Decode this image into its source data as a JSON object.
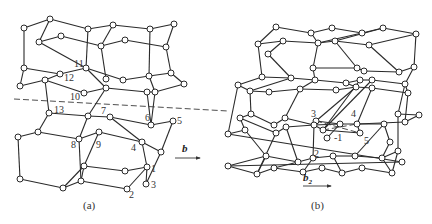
{
  "panels": [
    {
      "id": "a",
      "caption": "(a)",
      "caption_pos": [
        83,
        209
      ],
      "vector": {
        "label": "b",
        "subscript": "",
        "label_pos": [
          182,
          152
        ],
        "arrow": [
          [
            175,
            158
          ],
          [
            200,
            158
          ]
        ]
      },
      "dashed_line": [
        [
          14,
          99
        ],
        [
          228,
          111
        ]
      ],
      "nodes": [
        [
          24,
          28
        ],
        [
          50,
          19
        ],
        [
          88,
          29
        ],
        [
          113,
          25
        ],
        [
          150,
          29
        ],
        [
          174,
          24
        ],
        [
          39,
          42
        ],
        [
          61,
          36
        ],
        [
          101,
          46
        ],
        [
          125,
          40
        ],
        [
          166,
          47
        ],
        [
          24,
          68
        ],
        [
          60,
          74
        ],
        [
          86,
          68
        ],
        [
          106,
          79
        ],
        [
          123,
          80
        ],
        [
          149,
          76
        ],
        [
          171,
          73
        ],
        [
          184,
          84
        ],
        [
          20,
          86
        ],
        [
          45,
          80
        ],
        [
          84,
          93
        ],
        [
          106,
          88
        ],
        [
          147,
          92
        ],
        [
          155,
          92
        ],
        [
          49,
          113
        ],
        [
          88,
          116
        ],
        [
          110,
          117
        ],
        [
          151,
          125
        ],
        [
          173,
          121
        ],
        [
          38,
          132
        ],
        [
          18,
          137
        ],
        [
          79,
          139
        ],
        [
          99,
          132
        ],
        [
          142,
          142
        ],
        [
          161,
          152
        ],
        [
          84,
          166
        ],
        [
          125,
          171
        ],
        [
          147,
          167
        ],
        [
          20,
          179
        ],
        [
          63,
          188
        ],
        [
          81,
          181
        ],
        [
          127,
          189
        ],
        [
          146,
          184
        ]
      ],
      "edges": [
        [
          0,
          1
        ],
        [
          1,
          2
        ],
        [
          2,
          3
        ],
        [
          3,
          4
        ],
        [
          4,
          5
        ],
        [
          1,
          6
        ],
        [
          6,
          7
        ],
        [
          7,
          8
        ],
        [
          8,
          9
        ],
        [
          9,
          10
        ],
        [
          3,
          8
        ],
        [
          5,
          10
        ],
        [
          0,
          11
        ],
        [
          6,
          13
        ],
        [
          2,
          13
        ],
        [
          8,
          14
        ],
        [
          10,
          17
        ],
        [
          4,
          16
        ],
        [
          11,
          12
        ],
        [
          12,
          13
        ],
        [
          13,
          15
        ],
        [
          15,
          16
        ],
        [
          16,
          17
        ],
        [
          17,
          18
        ],
        [
          11,
          19
        ],
        [
          19,
          20
        ],
        [
          20,
          21
        ],
        [
          21,
          22
        ],
        [
          22,
          23
        ],
        [
          23,
          24
        ],
        [
          13,
          22
        ],
        [
          12,
          20
        ],
        [
          16,
          24
        ],
        [
          18,
          24
        ],
        [
          20,
          25
        ],
        [
          22,
          26
        ],
        [
          24,
          28
        ],
        [
          23,
          28
        ],
        [
          25,
          30
        ],
        [
          25,
          26
        ],
        [
          26,
          27
        ],
        [
          27,
          28
        ],
        [
          28,
          29
        ],
        [
          30,
          31
        ],
        [
          30,
          32
        ],
        [
          32,
          33
        ],
        [
          33,
          34
        ],
        [
          34,
          35
        ],
        [
          27,
          34
        ],
        [
          26,
          32
        ],
        [
          29,
          35
        ],
        [
          31,
          39
        ],
        [
          39,
          40
        ],
        [
          40,
          36
        ],
        [
          36,
          37
        ],
        [
          37,
          38
        ],
        [
          38,
          34
        ],
        [
          32,
          41
        ],
        [
          41,
          42
        ],
        [
          42,
          38
        ],
        [
          38,
          43
        ],
        [
          36,
          41
        ],
        [
          40,
          41
        ],
        [
          35,
          43
        ],
        [
          33,
          36
        ]
      ],
      "labels": [
        {
          "text": "11",
          "pos": [
            74,
            67
          ]
        },
        {
          "text": "12",
          "pos": [
            64,
            81
          ]
        },
        {
          "text": "10",
          "pos": [
            70,
            100
          ]
        },
        {
          "text": "13",
          "pos": [
            54,
            113
          ]
        },
        {
          "text": "7",
          "pos": [
            101,
            114
          ]
        },
        {
          "text": "6",
          "pos": [
            145,
            121
          ]
        },
        {
          "text": "5",
          "pos": [
            177,
            124
          ]
        },
        {
          "text": "8",
          "pos": [
            71,
            148
          ]
        },
        {
          "text": "9",
          "pos": [
            96,
            148
          ]
        },
        {
          "text": "4",
          "pos": [
            131,
            151
          ]
        },
        {
          "text": "1",
          "pos": [
            151,
            172
          ]
        },
        {
          "text": "3",
          "pos": [
            151,
            188
          ]
        },
        {
          "text": "2",
          "pos": [
            129,
            198
          ]
        }
      ]
    },
    {
      "id": "b",
      "caption": "(b)",
      "caption_pos": [
        311,
        209
      ],
      "vector": {
        "label": "b",
        "subscript": "2",
        "label_pos": [
          303,
          181
        ],
        "arrow": [
          [
            303,
            186
          ],
          [
            331,
            186
          ]
        ]
      },
      "dashed_line": null,
      "nodes": [
        [
          276,
          27
        ],
        [
          311,
          33
        ],
        [
          332,
          28
        ],
        [
          362,
          33
        ],
        [
          383,
          28
        ],
        [
          416,
          34
        ],
        [
          258,
          44
        ],
        [
          283,
          41
        ],
        [
          318,
          43
        ],
        [
          335,
          41
        ],
        [
          369,
          45
        ],
        [
          268,
          54
        ],
        [
          313,
          68
        ],
        [
          357,
          68
        ],
        [
          364,
          71
        ],
        [
          399,
          72
        ],
        [
          414,
          67
        ],
        [
          262,
          77
        ],
        [
          291,
          78
        ],
        [
          315,
          80
        ],
        [
          346,
          83
        ],
        [
          360,
          80
        ],
        [
          372,
          80
        ],
        [
          238,
          85
        ],
        [
          250,
          91
        ],
        [
          269,
          92
        ],
        [
          300,
          89
        ],
        [
          336,
          90
        ],
        [
          356,
          87
        ],
        [
          372,
          88
        ],
        [
          405,
          84
        ],
        [
          408,
          93
        ],
        [
          240,
          118
        ],
        [
          251,
          114
        ],
        [
          274,
          125
        ],
        [
          285,
          118
        ],
        [
          323,
          130
        ],
        [
          316,
          121
        ],
        [
          327,
          138
        ],
        [
          357,
          124
        ],
        [
          398,
          114
        ],
        [
          405,
          122
        ],
        [
          419,
          115
        ],
        [
          228,
          134
        ],
        [
          245,
          130
        ],
        [
          276,
          133
        ],
        [
          286,
          127
        ],
        [
          314,
          125
        ],
        [
          340,
          124
        ],
        [
          360,
          133
        ],
        [
          384,
          124
        ],
        [
          390,
          142
        ],
        [
          266,
          156
        ],
        [
          298,
          162
        ],
        [
          313,
          158
        ],
        [
          333,
          156
        ],
        [
          355,
          156
        ],
        [
          382,
          158
        ],
        [
          398,
          151
        ],
        [
          402,
          162
        ],
        [
          228,
          166
        ],
        [
          257,
          174
        ],
        [
          274,
          168
        ],
        [
          303,
          172
        ],
        [
          322,
          168
        ],
        [
          342,
          173
        ],
        [
          362,
          168
        ],
        [
          392,
          173
        ]
      ],
      "edges": [
        [
          0,
          1
        ],
        [
          1,
          2
        ],
        [
          2,
          3
        ],
        [
          3,
          4
        ],
        [
          4,
          5
        ],
        [
          0,
          6
        ],
        [
          6,
          7
        ],
        [
          7,
          8
        ],
        [
          8,
          9
        ],
        [
          9,
          10
        ],
        [
          3,
          8
        ],
        [
          5,
          10
        ],
        [
          1,
          8
        ],
        [
          4,
          9
        ],
        [
          6,
          17
        ],
        [
          11,
          18
        ],
        [
          7,
          11
        ],
        [
          8,
          12
        ],
        [
          9,
          13
        ],
        [
          10,
          15
        ],
        [
          5,
          16
        ],
        [
          15,
          16
        ],
        [
          12,
          13
        ],
        [
          12,
          19
        ],
        [
          13,
          14
        ],
        [
          14,
          15
        ],
        [
          19,
          20
        ],
        [
          20,
          21
        ],
        [
          21,
          22
        ],
        [
          22,
          30
        ],
        [
          30,
          31
        ],
        [
          16,
          30
        ],
        [
          17,
          18
        ],
        [
          17,
          23
        ],
        [
          18,
          19
        ],
        [
          23,
          24
        ],
        [
          24,
          25
        ],
        [
          25,
          26
        ],
        [
          26,
          27
        ],
        [
          27,
          28
        ],
        [
          28,
          29
        ],
        [
          29,
          31
        ],
        [
          18,
          24
        ],
        [
          19,
          26
        ],
        [
          20,
          28
        ],
        [
          24,
          33
        ],
        [
          26,
          35
        ],
        [
          21,
          36
        ],
        [
          22,
          36
        ],
        [
          28,
          37
        ],
        [
          29,
          39
        ],
        [
          31,
          41
        ],
        [
          30,
          40
        ],
        [
          40,
          42
        ],
        [
          41,
          42
        ],
        [
          23,
          43
        ],
        [
          43,
          44
        ],
        [
          44,
          32
        ],
        [
          32,
          33
        ],
        [
          33,
          34
        ],
        [
          34,
          35
        ],
        [
          35,
          47
        ],
        [
          47,
          36
        ],
        [
          36,
          49
        ],
        [
          49,
          39
        ],
        [
          39,
          41
        ],
        [
          32,
          45
        ],
        [
          45,
          46
        ],
        [
          46,
          47
        ],
        [
          47,
          48
        ],
        [
          48,
          50
        ],
        [
          50,
          51
        ],
        [
          37,
          47
        ],
        [
          37,
          48
        ],
        [
          38,
          48
        ],
        [
          43,
          59
        ],
        [
          59,
          60
        ],
        [
          60,
          52
        ],
        [
          52,
          53
        ],
        [
          53,
          54
        ],
        [
          54,
          55
        ],
        [
          55,
          56
        ],
        [
          56,
          57
        ],
        [
          57,
          58
        ],
        [
          44,
          52
        ],
        [
          45,
          61
        ],
        [
          46,
          53
        ],
        [
          47,
          54
        ],
        [
          50,
          56
        ],
        [
          51,
          57
        ],
        [
          40,
          58
        ],
        [
          60,
          61
        ],
        [
          61,
          62
        ],
        [
          62,
          63
        ],
        [
          63,
          64
        ],
        [
          64,
          65
        ],
        [
          65,
          66
        ],
        [
          66,
          67
        ],
        [
          52,
          61
        ],
        [
          54,
          63
        ],
        [
          55,
          65
        ],
        [
          57,
          67
        ],
        [
          58,
          67
        ],
        [
          53,
          62
        ]
      ],
      "labels": [
        {
          "text": "3",
          "pos": [
            311,
            117
          ]
        },
        {
          "text": "4",
          "pos": [
            351,
            117
          ]
        },
        {
          "text": "-1",
          "pos": [
            334,
            141
          ]
        },
        {
          "text": "5",
          "pos": [
            364,
            144
          ]
        },
        {
          "text": "2",
          "pos": [
            314,
            157
          ]
        }
      ],
      "dashed_edges": [
        [
          [
            316,
            121
          ],
          [
            360,
            133
          ]
        ],
        [
          [
            323,
            130
          ],
          [
            357,
            124
          ]
        ]
      ]
    }
  ]
}
